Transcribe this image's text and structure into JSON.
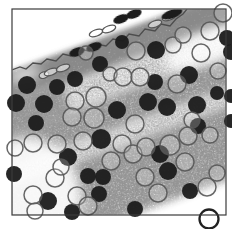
{
  "figure": {
    "alt": "stippled-tissue-micrograph-with-dark-and-open-cells",
    "colors": {
      "background": "#ffffff",
      "frame_stroke": "#3b3b3b",
      "membrane_stroke": "#4d4d4d",
      "dark_cell_fill": "#1f1f1f",
      "open_cell_stroke": "#575757",
      "open_cell_fill": "rgba(255,255,255,0.22)",
      "bold_cell_stroke": "#222222",
      "stipple_dark_base": "#a0a0a0",
      "stipple_mid_base": "#b3b3b3",
      "stipple_light_base": "#d4d4d4",
      "patch_fill": "#ffffff"
    },
    "frame": {
      "x": 12,
      "y": 9,
      "w": 214,
      "h": 206,
      "stroke_width": 1.2
    },
    "rotation": {
      "angle": -20,
      "cx": 120,
      "cy": 115
    },
    "bands": [
      [
        -60,
        39,
        400,
        9,
        "dark"
      ],
      [
        -60,
        39,
        400,
        28,
        "dark"
      ],
      [
        -60,
        67,
        400,
        28,
        "light"
      ],
      [
        -60,
        62,
        135,
        40,
        "mid"
      ],
      [
        -60,
        95,
        400,
        32,
        "mid"
      ],
      [
        -60,
        127,
        400,
        17,
        "light"
      ],
      [
        -60,
        144,
        400,
        68,
        "mid"
      ]
    ],
    "white_patches": [
      [
        207,
        48,
        46,
        16,
        -20,
        0.85
      ],
      [
        30,
        192,
        50,
        55,
        -20,
        0.9
      ],
      [
        24,
        75,
        17,
        6,
        -20,
        0.8
      ]
    ],
    "membrane": {
      "stroke_width": 1.3,
      "points": [
        [
          12,
          70
        ],
        [
          20,
          67
        ],
        [
          26,
          69
        ],
        [
          33,
          63
        ],
        [
          41,
          64
        ],
        [
          47,
          59
        ],
        [
          56,
          61
        ],
        [
          63,
          54
        ],
        [
          71,
          56
        ],
        [
          79,
          49
        ],
        [
          89,
          51
        ],
        [
          96,
          44
        ],
        [
          106,
          46
        ],
        [
          113,
          39
        ],
        [
          123,
          41
        ],
        [
          129,
          34
        ],
        [
          139,
          36
        ],
        [
          145,
          29
        ],
        [
          155,
          31
        ],
        [
          161,
          24
        ],
        [
          170,
          26
        ],
        [
          176,
          19
        ],
        [
          183,
          14
        ],
        [
          187,
          9
        ]
      ]
    },
    "surface_cells_dark": {
      "ry": 4.2,
      "rot": -20,
      "items": [
        [
          77,
          52,
          8
        ],
        [
          94,
          47,
          8
        ],
        [
          121,
          19,
          8
        ],
        [
          134,
          14,
          8
        ],
        [
          172,
          14,
          11
        ]
      ]
    },
    "surface_cells_open": {
      "ry": 3.2,
      "rot": -20,
      "stroke_width": 1.3,
      "items": [
        [
          44,
          75,
          5
        ],
        [
          51,
          72,
          7
        ],
        [
          63,
          68,
          7
        ],
        [
          96,
          33,
          7
        ],
        [
          109,
          29,
          7
        ],
        [
          155,
          24,
          7
        ],
        [
          169,
          17,
          7
        ]
      ]
    },
    "dark_cells": [
      [
        75,
        79,
        8
      ],
      [
        57,
        87,
        8
      ],
      [
        27,
        85,
        9
      ],
      [
        16,
        103,
        9
      ],
      [
        44,
        104,
        9
      ],
      [
        36,
        123,
        8
      ],
      [
        100,
        64,
        8
      ],
      [
        122,
        42,
        7
      ],
      [
        156,
        50,
        9
      ],
      [
        189,
        75,
        9
      ],
      [
        227,
        38,
        8
      ],
      [
        231,
        52,
        8
      ],
      [
        155,
        82,
        8
      ],
      [
        148,
        102,
        9
      ],
      [
        167,
        107,
        9
      ],
      [
        117,
        110,
        9
      ],
      [
        101,
        139,
        10
      ],
      [
        197,
        105,
        9
      ],
      [
        217,
        93,
        7
      ],
      [
        231,
        96,
        7
      ],
      [
        198,
        126,
        8
      ],
      [
        68,
        157,
        9
      ],
      [
        14,
        174,
        8
      ],
      [
        88,
        176,
        8
      ],
      [
        103,
        177,
        8
      ],
      [
        99,
        194,
        8
      ],
      [
        48,
        201,
        9
      ],
      [
        72,
        212,
        8
      ],
      [
        160,
        154,
        9
      ],
      [
        168,
        171,
        9
      ],
      [
        190,
        191,
        8
      ],
      [
        135,
        209,
        8
      ],
      [
        231,
        121,
        7
      ]
    ],
    "open_cells": [
      [
        86,
        53,
        7
      ],
      [
        110,
        74,
        7
      ],
      [
        123,
        77,
        9
      ],
      [
        140,
        77,
        9
      ],
      [
        96,
        97,
        10
      ],
      [
        94,
        118,
        10
      ],
      [
        75,
        101,
        9
      ],
      [
        72,
        117,
        9
      ],
      [
        83,
        141,
        9
      ],
      [
        33,
        143,
        9
      ],
      [
        57,
        144,
        9
      ],
      [
        15,
        148,
        8
      ],
      [
        136,
        51,
        9
      ],
      [
        173,
        45,
        8
      ],
      [
        183,
        35,
        8
      ],
      [
        210,
        31,
        9
      ],
      [
        223,
        13,
        9
      ],
      [
        201,
        53,
        9
      ],
      [
        218,
        71,
        8
      ],
      [
        177,
        84,
        9
      ],
      [
        135,
        124,
        9
      ],
      [
        122,
        144,
        9
      ],
      [
        133,
        154,
        9
      ],
      [
        146,
        147,
        9
      ],
      [
        111,
        161,
        9
      ],
      [
        170,
        145,
        10
      ],
      [
        185,
        162,
        9
      ],
      [
        188,
        136,
        9
      ],
      [
        158,
        193,
        9
      ],
      [
        145,
        177,
        9
      ],
      [
        77,
        196,
        9
      ],
      [
        88,
        206,
        9
      ],
      [
        33,
        195,
        9
      ],
      [
        35,
        211,
        8
      ],
      [
        55,
        178,
        9
      ],
      [
        61,
        167,
        8
      ],
      [
        192,
        120,
        8
      ],
      [
        210,
        135,
        8
      ],
      [
        207,
        187,
        9
      ],
      [
        217,
        173,
        8
      ]
    ],
    "bold_open_cell": {
      "x": 209,
      "y": 219,
      "r": 9.5,
      "stroke_width": 2.3
    },
    "open_cell_stroke_width": 1.5
  }
}
